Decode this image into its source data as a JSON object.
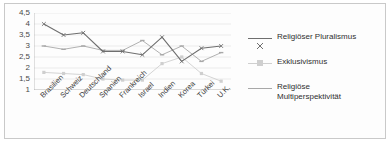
{
  "chart_data": {
    "type": "line",
    "title": "",
    "xlabel": "",
    "ylabel": "",
    "ylim": [
      1,
      4.5
    ],
    "ytick_step": 0.5,
    "grid": true,
    "legend_position": "right",
    "ytick_labels": [
      "4,5",
      "4",
      "3,5",
      "3",
      "2,5",
      "2",
      "1,5",
      "1"
    ],
    "ytick_values": [
      4.5,
      4,
      3.5,
      3,
      2.5,
      2,
      1.5,
      1
    ],
    "categories": [
      "Brasilien",
      "Schweiz",
      "Deutschland",
      "Spanien",
      "Frankreich",
      "Israel",
      "Indien",
      "Korea",
      "Türkei",
      "U.K."
    ],
    "series": [
      {
        "name": "Religiöser Pluralismus",
        "color": "#6f6f6f",
        "marker": "x",
        "values": [
          4.0,
          3.5,
          3.6,
          2.75,
          2.75,
          2.6,
          3.4,
          2.3,
          2.9,
          3.0
        ]
      },
      {
        "name": "Exklusivismus",
        "color": "#cfcfcf",
        "marker": "square",
        "values": [
          1.8,
          1.75,
          1.7,
          1.5,
          1.45,
          1.45,
          2.2,
          2.5,
          1.75,
          1.4
        ]
      },
      {
        "name": "Religiöse\nMultiperspektivität",
        "color": "#a8a8a8",
        "marker": "line",
        "values": [
          3.0,
          2.85,
          3.0,
          2.8,
          2.8,
          3.25,
          2.6,
          3.0,
          2.3,
          2.7
        ]
      }
    ]
  },
  "legend": {
    "entries": [
      {
        "label": "Religiöser Pluralismus"
      },
      {
        "label": "Exklusivismus"
      },
      {
        "label": "Religiöse\nMultiperspektivität"
      }
    ]
  }
}
